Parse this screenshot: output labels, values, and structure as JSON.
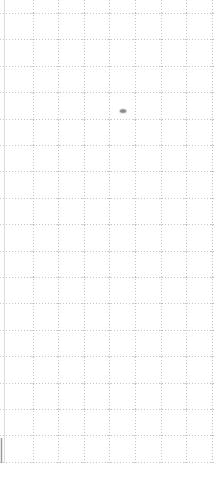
{
  "canvas": {
    "width": 219,
    "height": 493,
    "background_color": "#ffffff",
    "grid": {
      "style": "dotted",
      "dot_color": "#c6c6c6",
      "intersection_color": "#b4b4b4",
      "dash_pattern": "1 2",
      "vertical_lines_x": [
        33,
        58,
        84,
        109,
        135,
        161,
        186,
        212
      ],
      "vertical_extent_y": [
        0,
        462
      ],
      "horizontal_lines_y": [
        13,
        39,
        66,
        92,
        119,
        145,
        171,
        198,
        224,
        251,
        277,
        303,
        330,
        356,
        383,
        409,
        435,
        462
      ],
      "horizontal_extent_x": [
        0,
        216
      ],
      "left_border": {
        "x": 4,
        "y1": 0,
        "y2": 463,
        "color": "#dcdcdc",
        "style": "solid",
        "width": 1
      }
    },
    "marks": {
      "smudge_dot": {
        "cx": 123,
        "cy": 111,
        "rx": 3,
        "ry": 1.8,
        "color": "#8c8c8c",
        "halo_color": "#bdbdbd"
      },
      "left_edge_dark_segment": {
        "x": 1.5,
        "y1": 438,
        "y2": 463,
        "color": "#9a9a9a",
        "width": 1.5
      }
    }
  }
}
